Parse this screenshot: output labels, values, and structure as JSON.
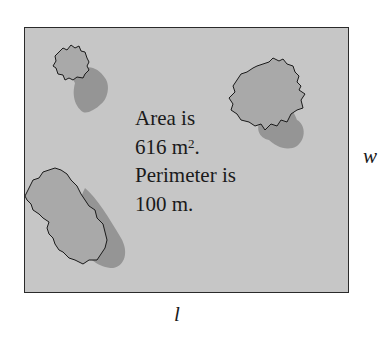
{
  "figure": {
    "text_lines": {
      "line1": "Area is",
      "line2_value": "616 m",
      "line2_exponent": "2",
      "line2_suffix": ".",
      "line3": "Perimeter is",
      "line4": "100 m."
    },
    "labels": {
      "width": "w",
      "length": "l"
    },
    "colors": {
      "ground": "#c6c6c6",
      "canopy": "#a9a9a9",
      "shadow": "#8f8f8f",
      "outline": "#1a1a1a"
    },
    "trees": [
      {
        "name": "small-tree-top-left"
      },
      {
        "name": "tree-top-right"
      },
      {
        "name": "large-tree-bottom-left"
      }
    ]
  }
}
